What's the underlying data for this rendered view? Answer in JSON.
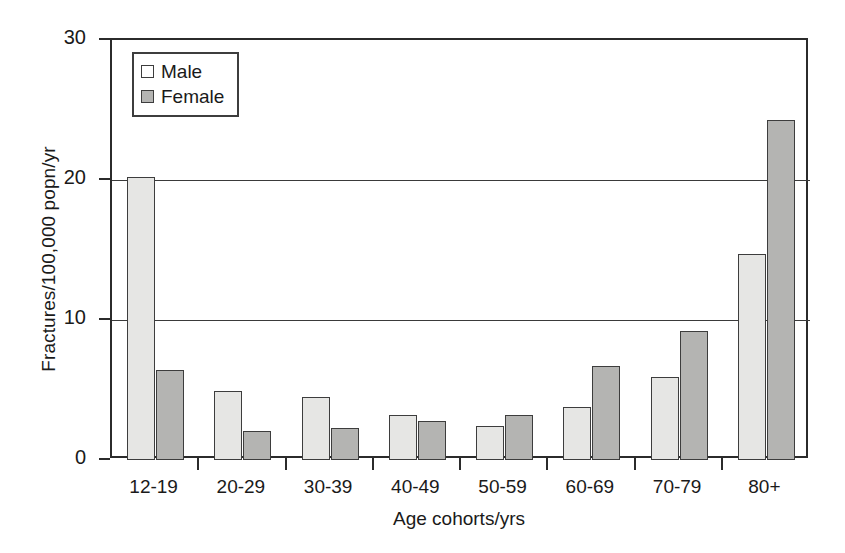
{
  "chart_data": {
    "type": "bar",
    "title": "",
    "xlabel": "Age cohorts/yrs",
    "ylabel": "Fractures/100,000 popn/yr",
    "categories": [
      "12-19",
      "20-29",
      "30-39",
      "40-49",
      "50-59",
      "60-69",
      "70-79",
      "80+"
    ],
    "series": [
      {
        "name": "Male",
        "values": [
          20.2,
          4.9,
          4.5,
          3.2,
          2.4,
          3.8,
          5.9,
          14.7
        ],
        "color": "#e6e6e4"
      },
      {
        "name": "Female",
        "values": [
          6.4,
          2.1,
          2.3,
          2.8,
          3.2,
          6.7,
          9.2,
          24.3
        ],
        "color": "#b4b4b2"
      }
    ],
    "ylim": [
      0,
      30
    ],
    "yticks": [
      0,
      10,
      20,
      30
    ],
    "ytick_labels": [
      "0",
      "10",
      "20",
      "30"
    ],
    "grid": "horizontal",
    "legend_position": "upper-left",
    "legend_entries": [
      "Male",
      "Female"
    ]
  },
  "axes": {
    "y_title": "Fractures/100,000 popn/yr",
    "x_title": "Age cohorts/yrs"
  },
  "legend": {
    "male_label": "Male",
    "female_label": "Female"
  }
}
